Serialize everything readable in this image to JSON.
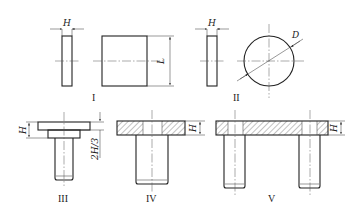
{
  "figure": {
    "views": [
      {
        "id": "I",
        "label": "I",
        "description": "Square plate: side view with thickness H, front view with side length L"
      },
      {
        "id": "II",
        "label": "II",
        "description": "Round plate: side view with thickness H, front view with diameter D"
      },
      {
        "id": "III",
        "label": "III",
        "description": "Stepped head pin: head thickness H, shoulder 2H/3"
      },
      {
        "id": "IV",
        "label": "IV",
        "description": "Plate with single pin, sectioned, thickness H"
      },
      {
        "id": "V",
        "label": "V",
        "description": "Plate with two pins, sectioned, thickness H"
      }
    ],
    "dimensions": {
      "thickness": "H",
      "length": "L",
      "diameter": "D",
      "shoulder": "2H/3"
    },
    "colors": {
      "line": "#222222",
      "background": "#ffffff"
    }
  }
}
